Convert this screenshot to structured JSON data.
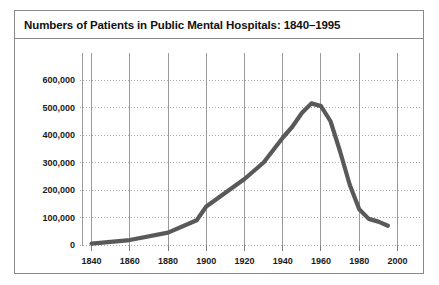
{
  "figure": {
    "title": "Numbers of Patients in Public Mental Hospitals: 1840–1995",
    "border_color": "#8a8a8a",
    "background": "#ffffff"
  },
  "chart_data": {
    "type": "line",
    "title": "Numbers of Patients in Public Mental Hospitals: 1840–1995",
    "xlabel": "",
    "ylabel": "",
    "xlim": [
      1835,
      2005
    ],
    "ylim": [
      0,
      640000
    ],
    "xticks": [
      1840,
      1860,
      1880,
      1900,
      1920,
      1940,
      1960,
      1980,
      2000
    ],
    "xticklabels": [
      "1840",
      "1860",
      "1880",
      "1900",
      "1920",
      "1940",
      "1960",
      "1980",
      "2000"
    ],
    "yticks": [
      0,
      100000,
      200000,
      300000,
      400000,
      500000,
      600000
    ],
    "yticklabels": [
      "0",
      "100,000",
      "200,000",
      "300,000",
      "400,000",
      "500,000",
      "600,000"
    ],
    "grid": {
      "horizontal": true,
      "horizontal_style": "dotted",
      "vertical": true,
      "vertical_style": "solid"
    },
    "legend": null,
    "line_color": "#595959",
    "line_width": 4,
    "series": [
      {
        "name": "Patients in public mental hospitals",
        "x": [
          1840,
          1860,
          1880,
          1895,
          1900,
          1910,
          1920,
          1930,
          1940,
          1945,
          1950,
          1955,
          1960,
          1965,
          1970,
          1975,
          1980,
          1985,
          1990,
          1995
        ],
        "y": [
          5000,
          18000,
          45000,
          90000,
          140000,
          190000,
          240000,
          300000,
          390000,
          430000,
          480000,
          515000,
          505000,
          450000,
          340000,
          220000,
          130000,
          95000,
          85000,
          70000
        ]
      }
    ]
  }
}
